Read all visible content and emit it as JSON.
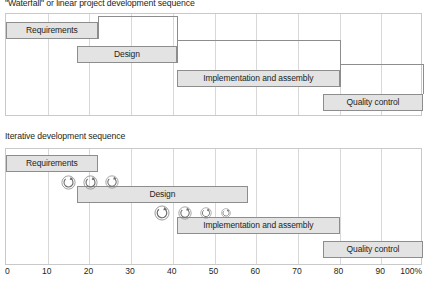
{
  "figure": {
    "width": 427,
    "height": 286,
    "background": "#ffffff",
    "bar_fill": "#e3e3e3",
    "bar_stroke": "#8d8d8d",
    "grid_color": "#d8d8d8",
    "frame_color": "#c9c9c9",
    "text_color": "#231f20"
  },
  "charts": [
    {
      "id": "waterfall",
      "title": "\"Waterfall\" or linear project development sequence",
      "bars": [
        {
          "label": "Requirements",
          "start": 0,
          "end": 22,
          "row": 0
        },
        {
          "label": "Design",
          "start": 17,
          "end": 41,
          "row": 1
        },
        {
          "label": "Implementation and assembly",
          "start": 41,
          "end": 80,
          "row": 2
        },
        {
          "label": "Quality control",
          "start": 76,
          "end": 100,
          "row": 3
        }
      ],
      "connectors": [
        {
          "from_bar": 0,
          "to_bar": 1
        },
        {
          "from_bar": 1,
          "to_bar": 2
        },
        {
          "from_bar": 2,
          "to_bar": 3
        }
      ]
    },
    {
      "id": "iterative",
      "title": "Iterative development sequence",
      "bars": [
        {
          "label": "Requirements",
          "start": 0,
          "end": 22,
          "row": 0
        },
        {
          "label": "Design",
          "start": 17,
          "end": 58,
          "row": 1
        },
        {
          "label": "Implementation and assembly",
          "start": 41,
          "end": 80,
          "row": 2
        },
        {
          "label": "Quality control",
          "start": 76,
          "end": 100,
          "row": 3
        }
      ],
      "iteration_groups": [
        {
          "after_bar": 0,
          "icons": [
            {
              "pos": 15.0,
              "size": 15
            },
            {
              "pos": 20.2,
              "size": 15
            },
            {
              "pos": 25.3,
              "size": 14
            }
          ]
        },
        {
          "after_bar": 1,
          "icons": [
            {
              "pos": 37.5,
              "size": 16
            },
            {
              "pos": 43.0,
              "size": 14
            },
            {
              "pos": 48.0,
              "size": 12
            },
            {
              "pos": 52.8,
              "size": 10
            }
          ]
        }
      ]
    }
  ],
  "axis": {
    "min": 0,
    "max": 100,
    "step": 10,
    "ticks": [
      "0",
      "10",
      "20",
      "30",
      "40",
      "50",
      "60",
      "70",
      "80",
      "90",
      "100%"
    ]
  }
}
